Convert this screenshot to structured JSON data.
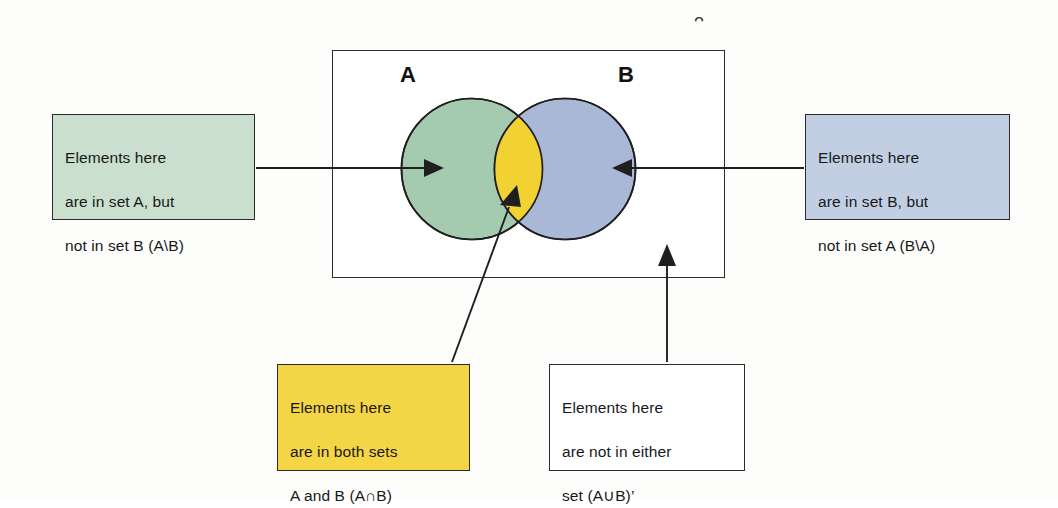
{
  "diagram": {
    "universe": {
      "symbol": "ᵔ",
      "name": "universal-set"
    },
    "sets": [
      {
        "id": "A",
        "label": "A",
        "fill": "#a4cbb0",
        "stroke": "#1f1f1f"
      },
      {
        "id": "B",
        "label": "B",
        "fill": "#aab8d8",
        "stroke": "#1f1f1f"
      }
    ],
    "intersection": {
      "label": "A∩B",
      "fill": "#f2d233"
    },
    "callouts": {
      "a_only": {
        "line1": "Elements here",
        "line2": "are in set A, but",
        "line3": "not in set B (A\\B)",
        "color": "#cadfce"
      },
      "b_only": {
        "line1": "Elements here",
        "line2": "are in set B, but",
        "line3": "not in set A (B\\A)",
        "color": "#c2cfe3"
      },
      "both": {
        "line1": "Elements here",
        "line2": "are in both sets",
        "line3": "A and B (A∩B)",
        "color": "#f4d545"
      },
      "neither": {
        "line1": "Elements here",
        "line2": "are not in either",
        "line3": "set (A∪B)’",
        "color": "#ffffff"
      }
    }
  }
}
